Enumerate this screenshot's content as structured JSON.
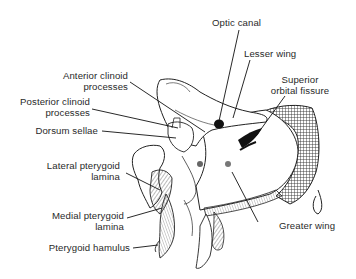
{
  "diagram": {
    "labels": [
      {
        "id": "optic-canal",
        "text": "Optic canal"
      },
      {
        "id": "lesser-wing",
        "text": "Lesser wing"
      },
      {
        "id": "superior-orbital-fissure",
        "line1": "Superior",
        "line2": "orbital fissure"
      },
      {
        "id": "anterior-clinoid-processes",
        "line1": "Anterior clinoid",
        "line2": "processes"
      },
      {
        "id": "posterior-clinoid-processes",
        "line1": "Posterior clinoid",
        "line2": "processes"
      },
      {
        "id": "dorsum-sellae",
        "text": "Dorsum sellae"
      },
      {
        "id": "lateral-pterygoid-lamina",
        "line1": "Lateral pterygoid",
        "line2": "lamina"
      },
      {
        "id": "medial-pterygoid-lamina",
        "line1": "Medial pterygoid",
        "line2": "lamina"
      },
      {
        "id": "pterygoid-hamulus",
        "text": "Pterygoid hamulus"
      },
      {
        "id": "greater-wing",
        "text": "Greater wing"
      }
    ]
  }
}
